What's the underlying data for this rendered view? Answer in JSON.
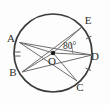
{
  "figure": {
    "type": "circle-geometry-diagram",
    "circle": {
      "center_label": "O",
      "center_x": 53,
      "center_y": 53,
      "radius": 39,
      "stroke_color": "#3a3a3a"
    },
    "points": [
      {
        "id": "A",
        "label": "A",
        "label_x": 11,
        "label_y": 42,
        "on_x": 19.5,
        "on_y": 42.5
      },
      {
        "id": "B",
        "label": "B",
        "label_x": 13,
        "label_y": 76,
        "on_x": 22,
        "on_y": 72
      },
      {
        "id": "C",
        "label": "C",
        "label_x": 80,
        "label_y": 91,
        "on_x": 77,
        "on_y": 81
      },
      {
        "id": "D",
        "label": "D",
        "label_x": 95,
        "label_y": 60,
        "on_x": 92,
        "on_y": 55
      },
      {
        "id": "E",
        "label": "E",
        "label_x": 88,
        "label_y": 24,
        "on_x": 82,
        "on_y": 27
      }
    ],
    "angle": {
      "label": "80°",
      "value": 80,
      "unit": "degrees",
      "vertex": "O",
      "ray_1": "E",
      "ray_2": "D",
      "label_x": 63,
      "label_y": 49
    },
    "segments": [
      {
        "from": "O",
        "to": "A",
        "kind": "radius"
      },
      {
        "from": "O",
        "to": "B",
        "kind": "radius"
      },
      {
        "from": "O",
        "to": "C",
        "kind": "radius"
      },
      {
        "from": "O",
        "to": "D",
        "kind": "radius"
      },
      {
        "from": "O",
        "to": "E",
        "kind": "radius"
      },
      {
        "from": "A",
        "to": "C",
        "kind": "chord"
      },
      {
        "from": "B",
        "to": "E",
        "kind": "chord"
      }
    ],
    "tick_marks": [
      {
        "on_arc": "AB",
        "count": 2,
        "note": "double hash between A and B"
      },
      {
        "on_arc": "ED",
        "count": 1,
        "note": "single hash between E and D"
      },
      {
        "on_arc": "DC",
        "count": 1,
        "note": "single hash between D and C"
      }
    ]
  }
}
